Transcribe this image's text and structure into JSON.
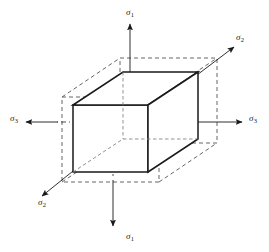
{
  "figure": {
    "type": "technical-diagram",
    "background_color": "#ffffff",
    "line_color": "#1a1a1a",
    "dashed_color": "#4d4d4d"
  },
  "axes": [
    {
      "id": "sigma1-top",
      "symbol": "σ",
      "subscript": "1",
      "orientation": "vertical-up",
      "label_x": 126,
      "label_y": 8
    },
    {
      "id": "sigma1-bottom",
      "symbol": "σ",
      "subscript": "1",
      "orientation": "vertical-down",
      "label_x": 126,
      "label_y": 232
    },
    {
      "id": "sigma2-upper",
      "symbol": "σ",
      "subscript": "2",
      "orientation": "diagonal-upper-right",
      "label_x": 236,
      "label_y": 33
    },
    {
      "id": "sigma2-lower",
      "symbol": "σ",
      "subscript": "2",
      "orientation": "diagonal-lower-left",
      "label_x": 38,
      "label_y": 198
    },
    {
      "id": "sigma3-right",
      "symbol": "σ",
      "subscript": "3",
      "orientation": "horizontal-right",
      "label_x": 249,
      "label_y": 114
    },
    {
      "id": "sigma3-left",
      "symbol": "σ",
      "subscript": "3",
      "orientation": "horizontal-left",
      "label_x": 10,
      "label_y": 114
    }
  ],
  "geometry": {
    "solid_cube": {
      "front_face": {
        "left": 73,
        "right": 148,
        "top": 105,
        "bottom": 172
      },
      "depth_offset": {
        "dx": 50,
        "dy": -33
      },
      "stroke_width": 1.4
    },
    "dashed_cube": {
      "front_face": {
        "left": 62,
        "right": 159,
        "top": 97,
        "bottom": 182
      },
      "depth_offset": {
        "dx": 58,
        "dy": -39
      },
      "stroke_width": 0.9,
      "dash_pattern": "4 3"
    }
  }
}
